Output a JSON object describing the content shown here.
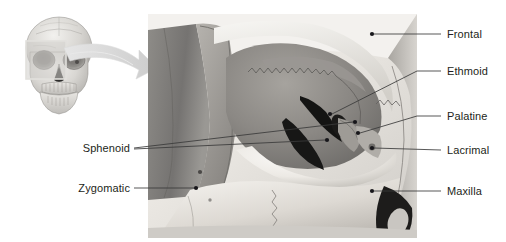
{
  "figure": {
    "background_color": "#ffffff",
    "text_color": "#231f20",
    "leader_color": "#3a3a3a",
    "width": 506,
    "height": 242
  },
  "thumbnail": {
    "name": "anterior-skull-thumbnail",
    "description": "Anterior view of human skull, grayscale",
    "highlight": {
      "name": "orbit-region-highlight",
      "color": "#d9d9d9"
    }
  },
  "zoom_arrow": {
    "name": "magnify-arrow",
    "color": "#d6d6d6",
    "direction": "left-to-right"
  },
  "detail_panel": {
    "name": "orbit-detail-illustration",
    "description": "Magnified grayscale view of the right bony orbit",
    "x": 148,
    "y": 14,
    "width": 269,
    "height": 224
  },
  "labels": [
    {
      "id": "frontal",
      "text": "Frontal",
      "side": "right",
      "text_x": 447,
      "text_y": 28,
      "line": [
        [
          441,
          34
        ],
        [
          372,
          34
        ]
      ],
      "dot": [
        372,
        34
      ]
    },
    {
      "id": "ethmoid",
      "text": "Ethmoid",
      "side": "right",
      "text_x": 447,
      "text_y": 65,
      "line": [
        [
          441,
          71
        ],
        [
          417,
          71
        ],
        [
          330,
          115
        ]
      ],
      "dot": [
        330,
        115
      ]
    },
    {
      "id": "palatine",
      "text": "Palatine",
      "side": "right",
      "text_x": 447,
      "text_y": 110,
      "line": [
        [
          441,
          116
        ],
        [
          417,
          116
        ],
        [
          358,
          133
        ]
      ],
      "dot": [
        358,
        133
      ]
    },
    {
      "id": "lacrimal",
      "text": "Lacrimal",
      "side": "right",
      "text_x": 447,
      "text_y": 144,
      "line": [
        [
          441,
          150
        ],
        [
          372,
          148
        ]
      ],
      "dot": [
        372,
        148
      ]
    },
    {
      "id": "maxilla",
      "text": "Maxilla",
      "side": "right",
      "text_x": 447,
      "text_y": 185,
      "line": [
        [
          441,
          191
        ],
        [
          372,
          191
        ]
      ],
      "dot": [
        372,
        191
      ]
    },
    {
      "id": "sphenoid",
      "text": "Sphenoid",
      "side": "left",
      "text_x": 72,
      "text_y": 142,
      "line_a": [
        [
          134,
          148
        ],
        [
          355,
          122
        ]
      ],
      "line_b": [
        [
          134,
          149
        ],
        [
          327,
          140
        ]
      ],
      "dot_a": [
        355,
        122
      ],
      "dot_b": [
        327,
        140
      ]
    },
    {
      "id": "zygomatic",
      "text": "Zygomatic",
      "side": "left",
      "text_x": 65,
      "text_y": 182,
      "line": [
        [
          134,
          188
        ],
        [
          196,
          188
        ]
      ],
      "dot": [
        196,
        188
      ]
    }
  ]
}
